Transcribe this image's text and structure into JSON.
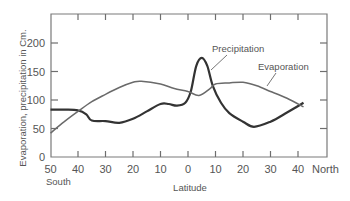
{
  "chart_data": {
    "type": "line",
    "title": "",
    "xlabel": "Latitude",
    "ylabel": "Evaporation, precipitation  in Cm.",
    "x_tick_labels": [
      "50",
      "40",
      "30",
      "20",
      "10",
      "0",
      "10",
      "20",
      "30",
      "40"
    ],
    "x_tick_values": [
      -50,
      -40,
      -30,
      -20,
      -10,
      0,
      10,
      20,
      30,
      40
    ],
    "x_end_labels": {
      "left": "South",
      "right": "North"
    },
    "y_tick_labels": [
      "0",
      "50",
      "100",
      "150",
      "200"
    ],
    "y_tick_values": [
      0,
      50,
      100,
      150,
      200
    ],
    "xlim": [
      -50,
      47
    ],
    "ylim": [
      0,
      250
    ],
    "grid": false,
    "legend": "inline annotations",
    "annotations": [
      "Precipitation",
      "Evaporation"
    ],
    "series": [
      {
        "name": "Precipitation",
        "x": [
          -50,
          -45,
          -40,
          -37,
          -35,
          -30,
          -25,
          -20,
          -15,
          -10,
          -7,
          -4,
          -1,
          1,
          3,
          5,
          7,
          9,
          12,
          15,
          20,
          24,
          30,
          36,
          42
        ],
        "values": [
          83,
          83,
          82,
          75,
          64,
          63,
          60,
          67,
          80,
          93,
          93,
          90,
          95,
          115,
          160,
          174,
          160,
          125,
          95,
          77,
          62,
          53,
          62,
          78,
          95
        ]
      },
      {
        "name": "Evaporation",
        "x": [
          -50,
          -45,
          -40,
          -35,
          -30,
          -25,
          -20,
          -17,
          -10,
          -5,
          0,
          4,
          8,
          10,
          15,
          20,
          25,
          30,
          36,
          42
        ],
        "values": [
          42,
          62,
          80,
          97,
          110,
          122,
          131,
          133,
          128,
          120,
          115,
          108,
          120,
          128,
          130,
          131,
          125,
          115,
          103,
          88
        ]
      }
    ]
  }
}
